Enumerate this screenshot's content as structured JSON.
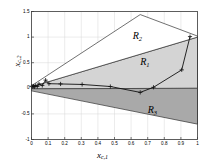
{
  "figure": {
    "background": "#ffffff",
    "frame_color": "#3a3a3a"
  },
  "axes": {
    "x_label_main": "x",
    "x_label_sub": "c,1",
    "y_label_main": "x",
    "y_label_sub": "c,2",
    "x_ticks": [
      "0",
      "0.1",
      "0.2",
      "0.3",
      "0.4",
      "0.5",
      "0.6",
      "0.7",
      "0.8",
      "0.9",
      "1"
    ],
    "x_tick_values": [
      0,
      0.1,
      0.2,
      0.3,
      0.4,
      0.5,
      0.6,
      0.7,
      0.8,
      0.9,
      1.0
    ],
    "y_ticks": [
      "1.5",
      "1",
      "0.5",
      "0",
      "-0.5",
      "-1"
    ],
    "y_tick_values": [
      1.5,
      1.0,
      0.5,
      0.0,
      -0.5,
      -1.0
    ],
    "xlim": [
      0,
      1
    ],
    "ylim": [
      -1,
      1.5
    ],
    "grid": true,
    "grid_color": "#d8d8d8"
  },
  "regions": [
    {
      "name": "R1",
      "label_main": "R",
      "label_sub": "1",
      "fill": "#d4d4d4",
      "edge": "#333333",
      "label_x": 0.655,
      "label_y": 0.52,
      "polygon": [
        [
          0,
          0.03
        ],
        [
          1.0,
          1.0
        ],
        [
          1.0,
          0.0
        ],
        [
          0,
          -0.01
        ]
      ]
    },
    {
      "name": "R2",
      "label_main": "R",
      "label_sub": "2",
      "fill": "#ffffff",
      "edge": "#333333",
      "label_x": 0.61,
      "label_y": 1.02,
      "polygon": [
        [
          0,
          0.05
        ],
        [
          0.655,
          1.44
        ],
        [
          1.0,
          1.02
        ],
        [
          1.0,
          1.0
        ],
        [
          0,
          0.03
        ]
      ]
    },
    {
      "name": "R3",
      "label_main": "R",
      "label_sub": "3",
      "fill": "#a9a9a9",
      "edge": "#333333",
      "label_x": 0.7,
      "label_y": -0.42,
      "polygon": [
        [
          0,
          -0.01
        ],
        [
          1.0,
          0.0
        ],
        [
          1.0,
          -0.7
        ],
        [
          0,
          -0.05
        ]
      ]
    }
  ],
  "trajectory": {
    "name": "state-trajectory",
    "line_color": "#111111",
    "marker": "plus",
    "points": [
      [
        0.955,
        1.01
      ],
      [
        0.905,
        0.36
      ],
      [
        0.735,
        0.02
      ],
      [
        0.655,
        -0.08
      ],
      [
        0.475,
        0.035
      ],
      [
        0.305,
        0.075
      ],
      [
        0.175,
        0.085
      ],
      [
        0.105,
        0.09
      ],
      [
        0.085,
        0.16
      ],
      [
        0.065,
        0.055
      ],
      [
        0.045,
        0.085
      ],
      [
        0.035,
        0.035
      ],
      [
        0.025,
        0.055
      ],
      [
        0.018,
        0.03
      ],
      [
        0.012,
        0.045
      ],
      [
        0.006,
        0.032
      ],
      [
        0.0,
        0.04
      ]
    ]
  }
}
